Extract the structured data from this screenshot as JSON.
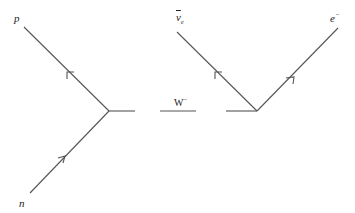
{
  "diagram": {
    "type": "feynman",
    "line_color": "#555555",
    "labels": {
      "proton": "p",
      "neutron": "n",
      "w_boson": "W",
      "w_charge": "−",
      "antineutrino_base": "ν",
      "antineutrino_sub": "e",
      "electron": "e",
      "electron_charge": "−"
    },
    "lines": [
      {
        "id": "proton",
        "from": [
          109,
          111
        ],
        "to": [
          24,
          27
        ],
        "arrow": "outgoing"
      },
      {
        "id": "neutron",
        "from": [
          30,
          193
        ],
        "to": [
          109,
          111
        ],
        "arrow": "incoming"
      },
      {
        "id": "w-left",
        "from": [
          109,
          111
        ],
        "to": [
          135,
          111
        ]
      },
      {
        "id": "w-middle",
        "from": [
          160,
          111
        ],
        "to": [
          196,
          111
        ]
      },
      {
        "id": "w-right",
        "from": [
          226,
          111
        ],
        "to": [
          257,
          111
        ]
      },
      {
        "id": "antineutrino",
        "from": [
          257,
          111
        ],
        "to": [
          177,
          32
        ],
        "arrow": "reversed"
      },
      {
        "id": "electron",
        "from": [
          257,
          111
        ],
        "to": [
          338,
          28
        ],
        "arrow": "outgoing"
      }
    ]
  }
}
